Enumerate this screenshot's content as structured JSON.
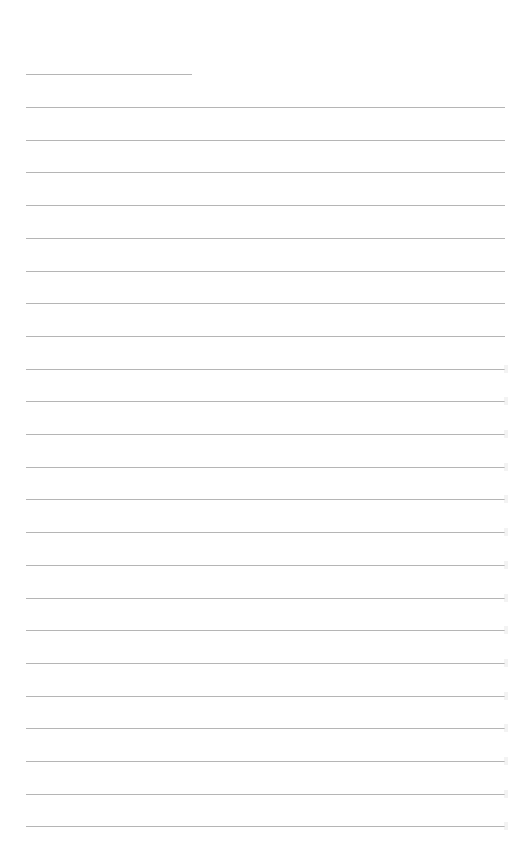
{
  "page": {
    "type": "ruled-paper",
    "line_color": "#a8a8a8",
    "background": "#ffffff",
    "header_line": {
      "left": 26,
      "top": 74,
      "width": 166
    },
    "ruled_lines": {
      "count": 23,
      "first_top": 107,
      "spacing": 32.7,
      "left": 26,
      "width": 479
    }
  }
}
